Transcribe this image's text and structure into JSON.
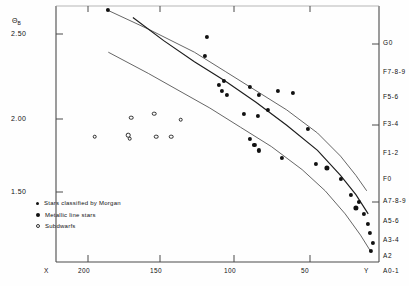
{
  "chart_data": {
    "type": "scatter",
    "title": "",
    "xlabel": "",
    "ylabel": "",
    "y_axis_symbol": "Θ",
    "y_axis_symbol_sub": "B",
    "grid": false,
    "x_axis": {
      "start_label": "X",
      "end_label": "Y",
      "ticks": [
        200,
        150,
        100,
        50
      ],
      "tick_labels": [
        "200",
        "150",
        "100",
        "50"
      ],
      "direction": "decreasing",
      "xlim": [
        230,
        20
      ]
    },
    "y_axis": {
      "ticks": [
        2.5,
        2.0,
        1.5
      ],
      "tick_labels": [
        "2.50",
        "2.00",
        "1.50"
      ],
      "direction": "decreasing-downward",
      "ylim": [
        1.35,
        2.68
      ]
    },
    "right_axis": {
      "name": "spectral-type",
      "labels": [
        "G0",
        "F7-8-9",
        "F5-6",
        "F3-4",
        "F1-2",
        "F0",
        "A7-8-9",
        "A5-6",
        "A3-4",
        "A2",
        "A0-1"
      ],
      "ticked": [
        "G0",
        "F3-4",
        "A7-8-9"
      ]
    },
    "legend": {
      "position": "lower-left",
      "entries": [
        {
          "marker": "filled-small-circle",
          "label": "Stars classified by Morgan"
        },
        {
          "marker": "filled-large-circle",
          "label": "Metallic line stars"
        },
        {
          "marker": "open-circle",
          "label": "Subdwarfs"
        }
      ]
    },
    "series": [
      {
        "name": "Stars classified by Morgan",
        "marker": "filled-circle",
        "points": [
          {
            "x": 196,
            "y": 2.66
          },
          {
            "x": 132,
            "y": 2.52
          },
          {
            "x": 133,
            "y": 2.42
          },
          {
            "x": 121,
            "y": 2.29
          },
          {
            "x": 124,
            "y": 2.27
          },
          {
            "x": 122,
            "y": 2.24
          },
          {
            "x": 119,
            "y": 2.22
          },
          {
            "x": 104,
            "y": 2.26
          },
          {
            "x": 98,
            "y": 2.22
          },
          {
            "x": 86,
            "y": 2.24
          },
          {
            "x": 76,
            "y": 2.23
          },
          {
            "x": 108,
            "y": 2.12
          },
          {
            "x": 99,
            "y": 2.11
          },
          {
            "x": 92,
            "y": 2.14
          },
          {
            "x": 66,
            "y": 2.04
          },
          {
            "x": 104,
            "y": 1.99
          },
          {
            "x": 101,
            "y": 1.96
          },
          {
            "x": 98,
            "y": 1.93
          },
          {
            "x": 83,
            "y": 1.89
          },
          {
            "x": 61,
            "y": 1.86
          },
          {
            "x": 45,
            "y": 1.78
          },
          {
            "x": 38,
            "y": 1.7
          },
          {
            "x": 33,
            "y": 1.66
          },
          {
            "x": 30,
            "y": 1.6
          },
          {
            "x": 27,
            "y": 1.55
          },
          {
            "x": 26,
            "y": 1.5
          },
          {
            "x": 24,
            "y": 1.45
          },
          {
            "x": 25,
            "y": 1.41
          }
        ]
      },
      {
        "name": "Metallic line stars",
        "marker": "filled-large-circle",
        "points": [
          {
            "x": 54,
            "y": 1.84
          },
          {
            "x": 35,
            "y": 1.63
          }
        ]
      },
      {
        "name": "Subdwarfs",
        "marker": "open-circle",
        "points": [
          {
            "x": 205,
            "y": 2.0
          },
          {
            "x": 183,
            "y": 2.01
          },
          {
            "x": 182,
            "y": 1.99
          },
          {
            "x": 181,
            "y": 2.1
          },
          {
            "x": 166,
            "y": 2.12
          },
          {
            "x": 165,
            "y": 2.0
          },
          {
            "x": 155,
            "y": 2.0
          },
          {
            "x": 149,
            "y": 2.09
          }
        ]
      }
    ],
    "curves": [
      {
        "name": "upper-envelope",
        "path": [
          [
            197,
            2.66
          ],
          [
            170,
            2.56
          ],
          [
            140,
            2.44
          ],
          [
            120,
            2.34
          ],
          [
            100,
            2.24
          ],
          [
            80,
            2.14
          ],
          [
            60,
            2.02
          ],
          [
            45,
            1.9
          ],
          [
            35,
            1.8
          ],
          [
            28,
            1.72
          ]
        ]
      },
      {
        "name": "mean-relation",
        "path": [
          [
            180,
            2.62
          ],
          [
            160,
            2.5
          ],
          [
            140,
            2.39
          ],
          [
            120,
            2.29
          ],
          [
            100,
            2.18
          ],
          [
            80,
            2.06
          ],
          [
            60,
            1.93
          ],
          [
            45,
            1.8
          ],
          [
            35,
            1.7
          ],
          [
            27,
            1.6
          ]
        ]
      },
      {
        "name": "lower-envelope",
        "path": [
          [
            196,
            2.44
          ],
          [
            170,
            2.33
          ],
          [
            150,
            2.24
          ],
          [
            130,
            2.15
          ],
          [
            110,
            2.05
          ],
          [
            90,
            1.95
          ],
          [
            70,
            1.83
          ],
          [
            55,
            1.72
          ],
          [
            42,
            1.6
          ],
          [
            32,
            1.49
          ],
          [
            25,
            1.4
          ]
        ]
      }
    ]
  }
}
